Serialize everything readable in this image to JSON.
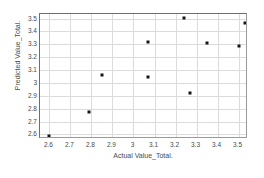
{
  "chart_data": {
    "type": "scatter",
    "title": "",
    "xlabel": "Actual Value_Total.",
    "ylabel": "Predicted Value_Total.",
    "xlim": [
      2.555,
      3.545
    ],
    "ylim": [
      2.565,
      3.535
    ],
    "grid": true,
    "legend": null,
    "xticks": [
      "2.6",
      "2.7",
      "2.8",
      "2.9",
      "3",
      "3.1",
      "3.2",
      "3.3",
      "3.4",
      "3.5"
    ],
    "xtick_values": [
      2.6,
      2.7,
      2.8,
      2.9,
      3.0,
      3.1,
      3.2,
      3.3,
      3.4,
      3.5
    ],
    "yticks": [
      "2.6",
      "2.7",
      "2.8",
      "2.9",
      "3",
      "3.1",
      "3.2",
      "3.3",
      "3.4",
      "3.5"
    ],
    "ytick_values": [
      2.6,
      2.7,
      2.8,
      2.9,
      3.0,
      3.1,
      3.2,
      3.3,
      3.4,
      3.5
    ],
    "marker": "square",
    "marker_color": "#151515",
    "grid_color": "#dcdcdc",
    "axis_color": "#6e6e6e",
    "points": [
      {
        "x": 2.6,
        "y": 2.585
      },
      {
        "x": 2.79,
        "y": 2.775
      },
      {
        "x": 2.85,
        "y": 3.065
      },
      {
        "x": 3.07,
        "y": 3.315
      },
      {
        "x": 3.07,
        "y": 3.05
      },
      {
        "x": 3.24,
        "y": 3.505
      },
      {
        "x": 3.27,
        "y": 2.92
      },
      {
        "x": 3.35,
        "y": 3.31
      },
      {
        "x": 3.5,
        "y": 3.29
      },
      {
        "x": 3.53,
        "y": 3.465
      }
    ]
  }
}
